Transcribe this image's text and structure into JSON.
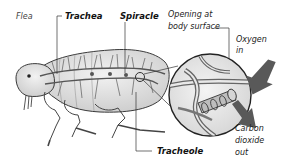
{
  "diagram": {
    "labels": {
      "flea": "Flea",
      "trachea": "Trachea",
      "spiracle": "Spiracle",
      "opening_line1": "Opening at",
      "opening_line2": "body surface",
      "oxygen_line1": "Oxygen",
      "oxygen_line2": "in",
      "co2_line1": "Carbon",
      "co2_line2": "dioxide",
      "co2_line3": "out",
      "tracheole": "Tracheole"
    },
    "colors": {
      "body_fill": "#e4e4e4",
      "outline": "#3a3a3a",
      "trachea": "#555555",
      "arrow": "#555555",
      "leader": "#333333"
    }
  }
}
